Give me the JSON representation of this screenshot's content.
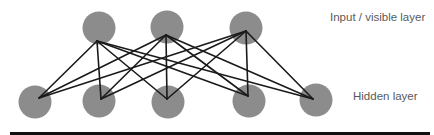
{
  "diagram": {
    "type": "bipartite-neural-network",
    "labels": {
      "visible_layer": "Input / visible layer",
      "hidden_layer": "Hidden layer"
    },
    "colors": {
      "node_fill": "#8c8c8c",
      "edge_stroke": "#1a1a1a",
      "label_text": "#595959",
      "rule": "#111111",
      "background": "#ffffff"
    },
    "node_radius": 16.5,
    "visible_nodes": [
      {
        "id": "v1",
        "cx": 99,
        "cy": 28,
        "anchor": [
          97,
          41
        ]
      },
      {
        "id": "v2",
        "cx": 167,
        "cy": 27,
        "anchor": [
          166,
          35
        ]
      },
      {
        "id": "v3",
        "cx": 246,
        "cy": 28,
        "anchor": [
          246,
          31
        ]
      }
    ],
    "hidden_nodes": [
      {
        "id": "h1",
        "cx": 35,
        "cy": 102,
        "anchor": [
          39,
          98
        ]
      },
      {
        "id": "h2",
        "cx": 99,
        "cy": 101,
        "anchor": [
          101,
          99
        ]
      },
      {
        "id": "h3",
        "cx": 168,
        "cy": 102,
        "anchor": [
          167,
          99
        ]
      },
      {
        "id": "h4",
        "cx": 249,
        "cy": 101,
        "anchor": [
          248,
          96
        ]
      },
      {
        "id": "h5",
        "cx": 316,
        "cy": 100,
        "anchor": [
          313,
          99
        ]
      }
    ],
    "edges": "fully-connected visible→hidden (3×5 = 15 edges)"
  }
}
